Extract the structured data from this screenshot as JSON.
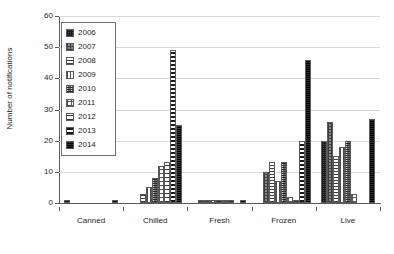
{
  "chart_data": {
    "type": "bar",
    "title": "",
    "xlabel": "",
    "ylabel": "Number of notifications",
    "ylim": [
      0,
      60
    ],
    "yticks": [
      0,
      10,
      20,
      30,
      40,
      50,
      60
    ],
    "ytick_labels": [
      "0",
      "10",
      "20",
      "30",
      "40",
      "50",
      "60"
    ],
    "grid": true,
    "legend_position": "upper-left-inside",
    "categories": [
      "Canned",
      "Chilled",
      "Fresh",
      "Frozen",
      "Live"
    ],
    "series": [
      {
        "name": "2006",
        "values": [
          1,
          0,
          0,
          0,
          20
        ]
      },
      {
        "name": "2007",
        "values": [
          0,
          0,
          1,
          10,
          26
        ]
      },
      {
        "name": "2008",
        "values": [
          0,
          3,
          1,
          13,
          15
        ]
      },
      {
        "name": "2009",
        "values": [
          0,
          5,
          1,
          7,
          18
        ]
      },
      {
        "name": "2010",
        "values": [
          0,
          8,
          1,
          13,
          20
        ]
      },
      {
        "name": "2011",
        "values": [
          0,
          12,
          1,
          2,
          3
        ]
      },
      {
        "name": "2012",
        "values": [
          0,
          13,
          1,
          1,
          0
        ]
      },
      {
        "name": "2013",
        "values": [
          0,
          49,
          0,
          20,
          0
        ]
      },
      {
        "name": "2014",
        "values": [
          1,
          25,
          1,
          46,
          27
        ]
      }
    ]
  },
  "legend": {
    "items": [
      {
        "label": "2006"
      },
      {
        "label": "2007"
      },
      {
        "label": "2008"
      },
      {
        "label": "2009"
      },
      {
        "label": "2010"
      },
      {
        "label": "2011"
      },
      {
        "label": "2012"
      },
      {
        "label": "2013"
      },
      {
        "label": "2014"
      }
    ]
  },
  "colors": {
    "axis": "#58595b",
    "grid": "#d9d9d9",
    "text": "#231f20",
    "background": "#ffffff"
  }
}
